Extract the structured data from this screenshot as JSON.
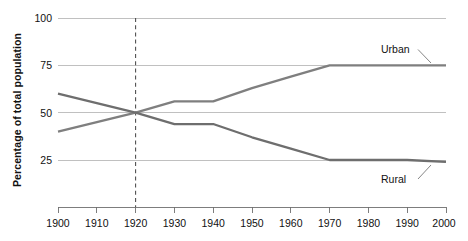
{
  "chart_data": {
    "type": "line",
    "title": "",
    "xlabel": "",
    "ylabel": "Percentage of total population",
    "x": [
      1900,
      1910,
      1920,
      1930,
      1940,
      1950,
      1960,
      1970,
      1980,
      1990,
      2000
    ],
    "xlim": [
      1900,
      2000
    ],
    "ylim": [
      0,
      100
    ],
    "yticks": [
      25,
      50,
      75,
      100
    ],
    "xticks": [
      1900,
      1910,
      1920,
      1930,
      1940,
      1950,
      1960,
      1970,
      1980,
      1990,
      2000
    ],
    "grid": "horizontal",
    "legend_position": "inline-annotations",
    "series": [
      {
        "name": "Urban",
        "color": "#7f7f7f",
        "values": [
          40,
          45,
          50,
          56,
          56,
          63,
          69,
          75,
          75,
          75,
          75
        ]
      },
      {
        "name": "Rural",
        "color": "#6e6e6e",
        "values": [
          60,
          55,
          50,
          44,
          44,
          37,
          31,
          25,
          25,
          25,
          24
        ]
      }
    ],
    "annotations": [
      {
        "label": "Urban",
        "kind": "series-callout",
        "points_to_year": 2000,
        "points_to_value": 75
      },
      {
        "label": "Rural",
        "kind": "series-callout",
        "points_to_year": 2000,
        "points_to_value": 24
      },
      {
        "label": "",
        "kind": "reference-line",
        "at_year": 1920,
        "style": "dashed-vertical",
        "note": "crossover of Urban and Rural at 50%"
      }
    ],
    "ytick_labels": [
      "25",
      "50",
      "75",
      "100"
    ],
    "xtick_labels": [
      "1900",
      "1910",
      "1920",
      "1930",
      "1940",
      "1950",
      "1960",
      "1970",
      "1980",
      "1990",
      "2000"
    ]
  },
  "axes": {
    "y_title": "Percentage of total population"
  },
  "colors": {
    "urban_line": "#7f7f7f",
    "rural_line": "#6e6e6e",
    "gridline": "#b9b9b9",
    "axis": "#6f6f6f",
    "refline": "#4a4a4a",
    "text": "#111111",
    "background": "#ffffff"
  }
}
